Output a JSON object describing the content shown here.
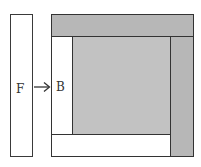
{
  "diagram": {
    "labels": {
      "front": "F",
      "back": "B"
    },
    "colors": {
      "strip_gray": "#b7b7b7",
      "inner_gray": "#c2c2c2",
      "white": "#ffffff",
      "line": "#333333"
    },
    "regions": [
      {
        "name": "F strip",
        "fill": "white"
      },
      {
        "name": "top strip",
        "fill": "gray"
      },
      {
        "name": "right strip",
        "fill": "gray"
      },
      {
        "name": "inner square",
        "fill": "gray"
      },
      {
        "name": "left strip B",
        "fill": "white"
      },
      {
        "name": "bottom strip",
        "fill": "white"
      }
    ],
    "arrow": {
      "from": "F",
      "to": "B"
    }
  }
}
